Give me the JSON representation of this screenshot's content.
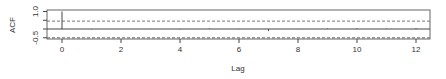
{
  "chart_data": {
    "type": "bar",
    "subtype": "acf-correlogram",
    "title": "",
    "xlabel": "Lag",
    "ylabel": "ACF",
    "xlim": [
      -0.5,
      12.5
    ],
    "ylim": [
      -0.5,
      1.0
    ],
    "x_ticks": [
      0,
      2,
      4,
      6,
      8,
      10,
      12
    ],
    "y_ticks": [
      "-0.5",
      "0.0",
      "0.5",
      "1.0"
    ],
    "y_tick_labels_shown": [
      "-0.5",
      "1.0"
    ],
    "confidence_band": [
      -0.45,
      0.45
    ],
    "lags": [
      0,
      1,
      2,
      3,
      4,
      5,
      6,
      7,
      8,
      9,
      10,
      11,
      12
    ],
    "values": [
      1.0,
      -0.02,
      0.0,
      0.01,
      -0.02,
      0.03,
      0.01,
      -0.12,
      -0.01,
      0.03,
      0.04,
      0.03,
      0.05
    ],
    "grid": false,
    "colors": {
      "lines": "#444444",
      "dashed": "#777777",
      "frame": "#666666"
    }
  }
}
